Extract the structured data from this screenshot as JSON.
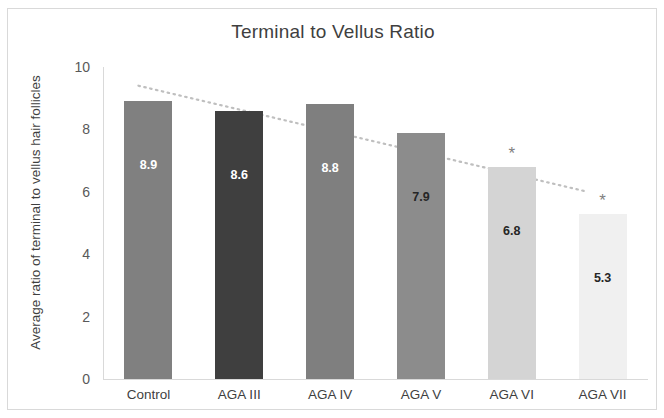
{
  "chart_data": {
    "type": "bar",
    "title": "Terminal to Vellus Ratio",
    "xlabel": "",
    "ylabel": "Average ratio of terminal to vellus hair follicles",
    "categories": [
      "Control",
      "AGA III",
      "AGA IV",
      "AGA V",
      "AGA VI",
      "AGA VII"
    ],
    "values": [
      8.9,
      8.6,
      8.8,
      7.9,
      6.8,
      5.3
    ],
    "value_labels": [
      "8.9",
      "8.6",
      "8.8",
      "7.9",
      "6.8",
      "5.3"
    ],
    "bar_colors": [
      "#808080",
      "#3f3f3f",
      "#7f7f7f",
      "#8c8c8c",
      "#d4d4d4",
      "#f0f0f0"
    ],
    "value_label_colors": [
      "#ffffff",
      "#ffffff",
      "#ffffff",
      "#262626",
      "#262626",
      "#262626"
    ],
    "significance_markers": [
      "",
      "",
      "",
      "",
      "*",
      "*"
    ],
    "ylim": [
      0,
      10
    ],
    "yticks": [
      "0",
      "2",
      "4",
      "6",
      "8",
      "10"
    ],
    "ytick_values": [
      0,
      2,
      4,
      6,
      8,
      10
    ],
    "grid": false,
    "legend": "none",
    "trendline": {
      "type": "linear-dotted",
      "color": "#bfbfbf",
      "start": [
        9.4,
        0
      ],
      "end": [
        6.0,
        5
      ]
    }
  }
}
